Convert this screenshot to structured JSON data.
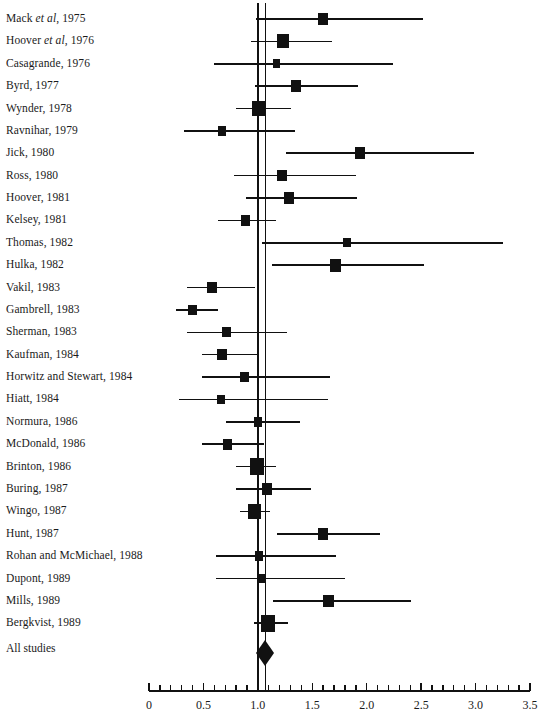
{
  "chart_data": {
    "type": "scatter",
    "subtype": "forest-plot",
    "title": "",
    "xlabel": "",
    "ylabel": "",
    "xlim": [
      0,
      3.5
    ],
    "xticks_major": [
      0,
      0.5,
      1.0,
      1.5,
      2.0,
      2.5,
      3.0,
      3.5
    ],
    "xtick_labels": [
      "0",
      "0.5",
      "1.0",
      "1.5",
      "2.0",
      "2.5",
      "3.0",
      "3.5"
    ],
    "xtick_minor_step": 0.1,
    "grid": false,
    "legend": "none",
    "null_line": 1.0,
    "pooled_line": 1.07,
    "summary": {
      "label": "All studies",
      "estimate": 1.07,
      "ci_low": 1.0,
      "ci_high": 1.14,
      "marker": "diamond"
    },
    "categories": [
      "Mack et al, 1975",
      "Hoover et al, 1976",
      "Casagrande, 1976",
      "Byrd, 1977",
      "Wynder, 1978",
      "Ravnihar, 1979",
      "Jick, 1980",
      "Ross, 1980",
      "Hoover, 1981",
      "Kelsey, 1981",
      "Thomas, 1982",
      "Hulka, 1982",
      "Vakil, 1983",
      "Gambrell, 1983",
      "Sherman, 1983",
      "Kaufman, 1984",
      "Horwitz and Stewart, 1984",
      "Hiatt, 1984",
      "Normura, 1986",
      "McDonald, 1986",
      "Brinton, 1986",
      "Buring, 1987",
      "Wingo, 1987",
      "Hunt, 1987",
      "Rohan and McMichael, 1988",
      "Dupont, 1989",
      "Mills, 1989",
      "Bergkvist, 1989"
    ],
    "values": [
      1.6,
      1.23,
      1.17,
      1.35,
      1.01,
      0.67,
      1.94,
      1.22,
      1.29,
      0.89,
      1.82,
      1.71,
      0.58,
      0.4,
      0.71,
      0.67,
      0.88,
      0.66,
      1.0,
      0.72,
      0.99,
      1.08,
      0.97,
      1.6,
      1.01,
      1.03,
      1.65,
      1.09
    ],
    "ci_low": [
      0.98,
      0.94,
      0.6,
      0.97,
      0.8,
      0.32,
      1.26,
      0.78,
      0.89,
      0.63,
      1.04,
      1.13,
      0.35,
      0.25,
      0.35,
      0.49,
      0.49,
      0.28,
      0.71,
      0.49,
      0.8,
      0.8,
      0.84,
      1.18,
      0.62,
      0.62,
      1.14,
      0.96
    ],
    "ci_high": [
      2.52,
      1.68,
      2.24,
      1.92,
      1.3,
      1.34,
      2.99,
      1.9,
      1.91,
      1.17,
      3.25,
      2.53,
      0.97,
      0.63,
      1.27,
      0.99,
      1.66,
      1.64,
      1.39,
      1.06,
      1.17,
      1.49,
      1.11,
      2.12,
      1.72,
      1.8,
      2.41,
      1.28
    ],
    "weights": [
      0.3,
      0.62,
      0.13,
      0.4,
      0.82,
      0.17,
      0.36,
      0.34,
      0.36,
      0.26,
      0.12,
      0.5,
      0.28,
      0.24,
      0.22,
      0.28,
      0.22,
      0.13,
      0.21,
      0.29,
      1.0,
      0.35,
      0.72,
      0.42,
      0.18,
      0.15,
      0.4,
      0.95
    ]
  },
  "labels": {
    "rows": [
      {
        "prefix": "Mack ",
        "italic": "et al",
        "suffix": ", 1975"
      },
      {
        "prefix": "Hoover ",
        "italic": "et al",
        "suffix": ", 1976"
      },
      {
        "prefix": "Casagrande, 1976",
        "italic": "",
        "suffix": ""
      },
      {
        "prefix": "Byrd, 1977",
        "italic": "",
        "suffix": ""
      },
      {
        "prefix": "Wynder, 1978",
        "italic": "",
        "suffix": ""
      },
      {
        "prefix": "Ravnihar, 1979",
        "italic": "",
        "suffix": ""
      },
      {
        "prefix": "Jick, 1980",
        "italic": "",
        "suffix": ""
      },
      {
        "prefix": "Ross, 1980",
        "italic": "",
        "suffix": ""
      },
      {
        "prefix": "Hoover, 1981",
        "italic": "",
        "suffix": ""
      },
      {
        "prefix": "Kelsey, 1981",
        "italic": "",
        "suffix": ""
      },
      {
        "prefix": "Thomas, 1982",
        "italic": "",
        "suffix": ""
      },
      {
        "prefix": "Hulka, 1982",
        "italic": "",
        "suffix": ""
      },
      {
        "prefix": "Vakil, 1983",
        "italic": "",
        "suffix": ""
      },
      {
        "prefix": "Gambrell, 1983",
        "italic": "",
        "suffix": ""
      },
      {
        "prefix": "Sherman, 1983",
        "italic": "",
        "suffix": ""
      },
      {
        "prefix": "Kaufman, 1984",
        "italic": "",
        "suffix": ""
      },
      {
        "prefix": "Horwitz and Stewart, 1984",
        "italic": "",
        "suffix": ""
      },
      {
        "prefix": "Hiatt, 1984",
        "italic": "",
        "suffix": ""
      },
      {
        "prefix": "Normura, 1986",
        "italic": "",
        "suffix": ""
      },
      {
        "prefix": "McDonald, 1986",
        "italic": "",
        "suffix": ""
      },
      {
        "prefix": "Brinton, 1986",
        "italic": "",
        "suffix": ""
      },
      {
        "prefix": "Buring, 1987",
        "italic": "",
        "suffix": ""
      },
      {
        "prefix": "Wingo, 1987",
        "italic": "",
        "suffix": ""
      },
      {
        "prefix": "Hunt, 1987",
        "italic": "",
        "suffix": ""
      },
      {
        "prefix": "Rohan and McMichael, 1988",
        "italic": "",
        "suffix": ""
      },
      {
        "prefix": "Dupont, 1989",
        "italic": "",
        "suffix": ""
      },
      {
        "prefix": "Mills, 1989",
        "italic": "",
        "suffix": ""
      },
      {
        "prefix": "Bergkvist, 1989",
        "italic": "",
        "suffix": ""
      }
    ],
    "all_studies": "All studies"
  },
  "colors": {
    "ink": "#111111",
    "background": "#ffffff"
  },
  "geometry": {
    "x_origin_px": 149,
    "px_per_unit": 108.86,
    "row_first_y": 19,
    "row_step": 22.38,
    "summary_y": 653,
    "axis_y": 690
  }
}
